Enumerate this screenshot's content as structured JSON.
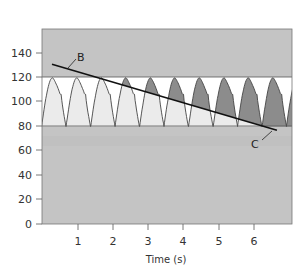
{
  "chart_data": {
    "type": "line",
    "title": "",
    "xlabel": "Time (s)",
    "ylabel": "",
    "xlim": [
      0,
      7.07
    ],
    "ylim": [
      0,
      160
    ],
    "x_ticks": [
      1,
      2,
      3,
      4,
      5,
      6
    ],
    "y_ticks": [
      0,
      20,
      40,
      60,
      80,
      100,
      120,
      140
    ],
    "grid": false,
    "legend": null,
    "reference_bands": [
      {
        "name": "upper",
        "from": 120,
        "to": 160,
        "color": "#c4c4c4"
      },
      {
        "name": "pressure-window",
        "from": 80,
        "to": 120,
        "color": "#ffffff"
      },
      {
        "name": "lower",
        "from": 0,
        "to": 80,
        "color": "#c4c4c4"
      }
    ],
    "series": [
      {
        "name": "pressure waveform",
        "description": "Periodic pulses oscillating between trough 80 and peak 120, with dicrotic notch on the falling limb",
        "min": 80,
        "max": 120,
        "period_s": 0.695,
        "peak_times_s": [
          0.32,
          1.02,
          1.71,
          2.41,
          3.1,
          3.8,
          4.49,
          5.19,
          5.88,
          6.58
        ],
        "trough_times_s": [
          0.66,
          1.36,
          2.05,
          2.75,
          3.44,
          4.14,
          4.84,
          5.53,
          6.23,
          6.92
        ],
        "fill_below_line": "#ebebeb",
        "fill_above_line": "#8c8c8c"
      },
      {
        "name": "line B-C",
        "points": [
          {
            "x": 0.26,
            "y": 131
          },
          {
            "x": 6.65,
            "y": 77
          }
        ]
      }
    ],
    "annotations": [
      {
        "label": "B",
        "x": 1.0,
        "y": 136
      },
      {
        "label": "C",
        "x": 6.0,
        "y": 66
      }
    ]
  },
  "axes": {
    "x_title": "Time (s)",
    "x_tick_labels": [
      "1",
      "2",
      "3",
      "4",
      "5",
      "6"
    ],
    "y_tick_labels": [
      "0",
      "20",
      "40",
      "60",
      "80",
      "100",
      "120",
      "140"
    ]
  },
  "labels": {
    "b": "B",
    "c": "C"
  }
}
